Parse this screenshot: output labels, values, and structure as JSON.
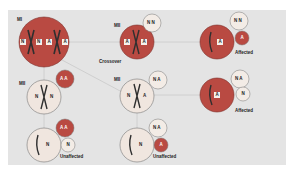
{
  "diagram": {
    "colors": {
      "panel": "#e4e4e4",
      "affected_cell": "#b94a42",
      "unaffected_cell": "#f0e6df",
      "chromosome": "#2f2f2f",
      "connector": "#c9c9c9",
      "allele_box": "#f6f1ec"
    },
    "stage_labels": {
      "top_left": "MI",
      "top_mid": "MII",
      "mid_left": "MII",
      "mid_mid": "MII"
    },
    "crossover_label": "Crossover",
    "outcomes": {
      "top_right": "Affected",
      "mid_right": "Affected",
      "bottom_left": "Unaffected",
      "bottom_mid": "Unaffected"
    },
    "cells": [
      {
        "id": "mi-cell",
        "alleles": [
          "N",
          "N",
          "A",
          "A"
        ]
      },
      {
        "id": "mii-top",
        "alleles": [
          "A",
          "A"
        ],
        "polar_body": [
          "N",
          "N"
        ]
      },
      {
        "id": "egg-top",
        "alleles": [
          "A"
        ],
        "polar_bodies": [
          [
            "N",
            "N"
          ],
          [
            "A"
          ]
        ]
      },
      {
        "id": "mii-left",
        "alleles": [
          "N",
          "N"
        ],
        "polar_body": [
          "A",
          "A"
        ]
      },
      {
        "id": "mii-mid",
        "alleles": [
          "N",
          "A"
        ],
        "polar_body": [
          "N",
          "A"
        ]
      },
      {
        "id": "egg-mid",
        "alleles": [
          "A"
        ],
        "polar_bodies": [
          [
            "N",
            "A"
          ],
          [
            "N"
          ]
        ]
      },
      {
        "id": "egg-bottom-left",
        "alleles": [
          "N"
        ],
        "polar_bodies": [
          [
            "A",
            "A"
          ],
          [
            "N"
          ]
        ]
      },
      {
        "id": "egg-bottom-mid",
        "alleles": [
          "N"
        ],
        "polar_bodies": [
          [
            "N",
            "A"
          ],
          [
            "A"
          ]
        ]
      }
    ],
    "allele_text": {
      "c1": [
        "N",
        "N",
        "A",
        "A"
      ],
      "c2": [
        "A",
        "A"
      ],
      "c2pb": "N N",
      "c3": "A",
      "c3pb1": "N N",
      "c3pb2": "A",
      "c4": [
        "N",
        "N"
      ],
      "c4pb": "A A",
      "c5": [
        "N",
        "A"
      ],
      "c5pb": "N A",
      "c6": "A",
      "c6pb1": "N A",
      "c6pb2": "N",
      "c7": "N",
      "c7pb1": "A A",
      "c7pb2": "N",
      "c8": "N",
      "c8pb1": "N A",
      "c8pb2": "A"
    }
  }
}
